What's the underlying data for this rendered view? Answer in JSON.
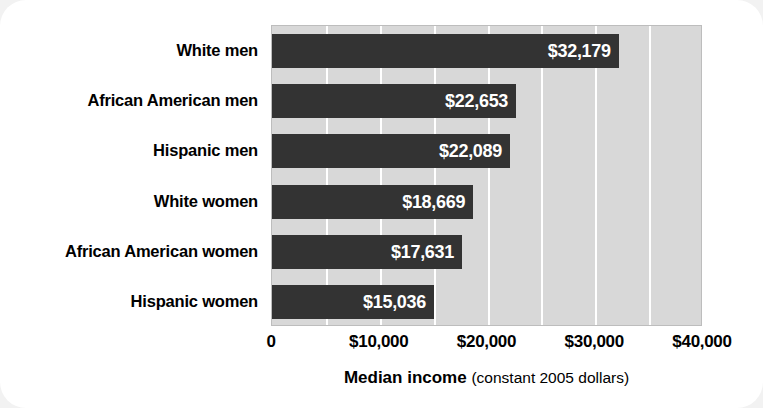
{
  "chart_data": {
    "type": "bar",
    "orientation": "horizontal",
    "title": "",
    "xlabel": "Median income (constant 2005 dollars)",
    "xlabel_bold_part": "Median income",
    "xlabel_normal_part": "(constant 2005 dollars)",
    "ylabel": "",
    "categories": [
      "White men",
      "African American men",
      "Hispanic men",
      "White women",
      "African American women",
      "Hispanic women"
    ],
    "values": [
      32179,
      22653,
      22089,
      18669,
      17631,
      15036
    ],
    "value_labels": [
      "$32,179",
      "$22,653",
      "$22,089",
      "$18,669",
      "$17,631",
      "$15,036"
    ],
    "xlim": [
      0,
      40000
    ],
    "xticks": [
      0,
      10000,
      20000,
      30000,
      40000
    ],
    "xtick_labels": [
      "0",
      "$10,000",
      "$20,000",
      "$30,000",
      "$40,000"
    ],
    "gridlines": [
      5000,
      10000,
      15000,
      20000,
      25000,
      30000,
      35000
    ],
    "grid": true,
    "grid_interval": 5000,
    "legend": null,
    "colors": {
      "bar": "#333333",
      "plot_background": "#d8d8d8",
      "gridline": "#ffffff",
      "figure_background": "#ffffff",
      "outer_background": "#f2f2f2",
      "value_label_text": "#ffffff",
      "category_label_text": "#000000",
      "plot_border": "#bdbdbd"
    }
  }
}
